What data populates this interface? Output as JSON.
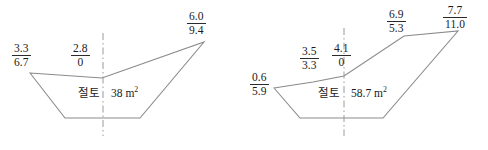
{
  "figures": [
    {
      "name": "left-cross-section",
      "area_label": {
        "kind": "절토",
        "value": "38",
        "unit": "m",
        "exponent": "2"
      },
      "stakes": [
        {
          "id": "left-outer",
          "num": "3.3",
          "den": "6.7"
        },
        {
          "id": "center",
          "num": "2.8",
          "den": "0"
        },
        {
          "id": "right-outer",
          "num": "6.0",
          "den": "9.4"
        }
      ],
      "outline_points": "30,73 102,78 204,42 140,118 65,118",
      "centerline": {
        "x": 103,
        "y1": 33,
        "y2": 136
      }
    },
    {
      "name": "right-cross-section",
      "area_label": {
        "kind": "절토",
        "value": "58.7",
        "unit": "m",
        "exponent": "2"
      },
      "stakes": [
        {
          "id": "left-outer",
          "num": "0.6",
          "den": "5.9"
        },
        {
          "id": "left-inner",
          "num": "3.5",
          "den": "3.3"
        },
        {
          "id": "center",
          "num": "4.1",
          "den": "0"
        },
        {
          "id": "right-inner",
          "num": "6.9",
          "den": "5.3"
        },
        {
          "id": "right-outer",
          "num": "7.7",
          "den": "11.0"
        }
      ],
      "outline_points": "274,88 313,82 344,76 404,36 458,31 383,118 300,118",
      "centerline": {
        "x": 344,
        "y1": 28,
        "y2": 136
      }
    }
  ],
  "colors": {
    "outline": "#8a8a8a",
    "centerline": "#9a9a9a",
    "text": "#1a1a1a",
    "background": "#ffffff"
  }
}
